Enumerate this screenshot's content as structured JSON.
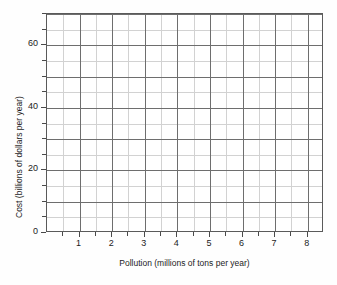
{
  "chart_data": {
    "type": "scatter",
    "title": "",
    "subtitle": "",
    "xlabel": "Pollution (millions of tons per year)",
    "ylabel": "Cost (billions of dollars per year)",
    "xlim": [
      0,
      8.5
    ],
    "ylim": [
      0,
      70
    ],
    "xticks": [
      1,
      2,
      3,
      4,
      5,
      6,
      7,
      8
    ],
    "xticklabels": [
      "1",
      "2",
      "3",
      "4",
      "5",
      "6",
      "7",
      "8"
    ],
    "yticks": [
      0,
      20,
      40,
      60
    ],
    "yticklabels": [
      "0",
      "20",
      "40",
      "60"
    ],
    "x_major_gridlines": [
      1,
      2,
      3,
      4,
      5,
      6,
      7,
      8
    ],
    "x_minor_gridlines": [
      0.5,
      1.5,
      2.5,
      3.5,
      4.5,
      5.5,
      6.5,
      7.5
    ],
    "y_major_gridlines": [
      10,
      20,
      30,
      40,
      50,
      60,
      70
    ],
    "y_minor_gridlines": [
      5,
      15,
      25,
      35,
      45,
      55,
      65
    ],
    "grid": true,
    "legend": null,
    "series": [
      {
        "name": "",
        "x": [],
        "y": []
      }
    ],
    "annotations": [],
    "colors": {
      "background": "#ffffff",
      "frame": "#5a5a5a",
      "major_gridline": "#6e6e6e",
      "minor_gridline": "#d2d2d2",
      "text": "#1c1c1c"
    }
  }
}
